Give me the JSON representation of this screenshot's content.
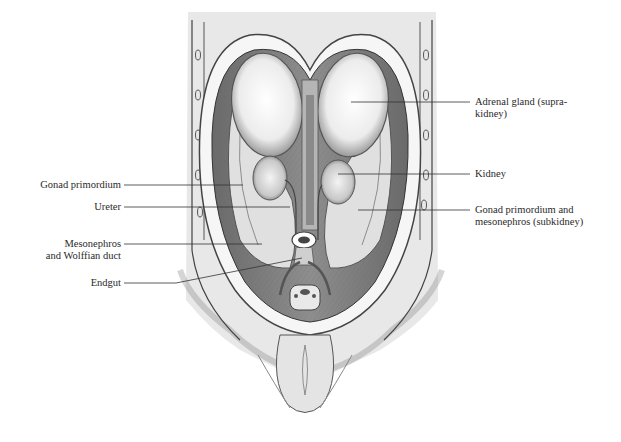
{
  "figure": {
    "line_color": "#333333",
    "shade_dark": "#6e6e6e",
    "shade_mid": "#a8a8a8",
    "shade_light": "#d9d9d9"
  },
  "labels_left": [
    {
      "id": "gonad-primordium",
      "lines": [
        "Gonad primordium"
      ]
    },
    {
      "id": "ureter",
      "lines": [
        "Ureter"
      ]
    },
    {
      "id": "mesonephros",
      "lines": [
        "Mesonephros",
        "and Wolffian duct"
      ]
    },
    {
      "id": "endgut",
      "lines": [
        "Endgut"
      ]
    }
  ],
  "labels_right": [
    {
      "id": "adrenal-gland",
      "lines": [
        "Adrenal gland (supra-",
        "kidney)"
      ]
    },
    {
      "id": "kidney",
      "lines": [
        "Kidney"
      ]
    },
    {
      "id": "gonad-mesonephros",
      "lines": [
        "Gonad primordium and",
        "mesonephros (subkidney)"
      ]
    }
  ]
}
